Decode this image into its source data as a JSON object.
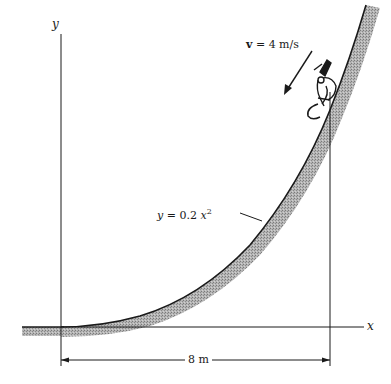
{
  "diagram": {
    "axes": {
      "y_label": "y",
      "x_label": "x"
    },
    "velocity": {
      "symbol": "v",
      "equals": " = ",
      "value": "4 m/s"
    },
    "curve_equation": {
      "lhs": "y",
      "middle": " = 0.2 ",
      "var": "x",
      "exponent": "2"
    },
    "dimension": {
      "label": "8 m"
    },
    "colors": {
      "ink": "#1a1a1a",
      "hatch": "#9a9a9a"
    }
  }
}
